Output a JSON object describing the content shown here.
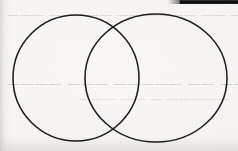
{
  "document": {
    "kind": "scanned-page-photo",
    "caption": "Two overlapping circles drawn in dark ink on off-white paper",
    "background_color": "#f5f4f2",
    "ink_color": "#1e1c1b",
    "ghost_text_color": "#b9b6b1",
    "edge_bar_color": "#0c0c0c"
  },
  "figure": {
    "name": "two-overlapping-circles",
    "type": "venn-diagram",
    "shape_count": 2,
    "stroke_width_px": 1.55,
    "circles": [
      {
        "label": "left-circle",
        "center_x": 76,
        "center_y": 78,
        "radius_x": 63,
        "radius_y": 63
      },
      {
        "label": "right-circle",
        "center_x": 156,
        "center_y": 78,
        "radius_x": 71,
        "radius_y": 64
      }
    ],
    "intersections": [
      {
        "label": "upper-intersection",
        "x": 116,
        "y": 28
      },
      {
        "label": "lower-intersection",
        "x": 116,
        "y": 130
      }
    ]
  },
  "artifacts": {
    "edge_bar": {
      "label": "page-edge-bar",
      "x": 180,
      "y": 0,
      "width": 58,
      "height": 4
    },
    "ghost_text": {
      "note": "Mirrored bleed-through from the reverse side of the sheet; illegible",
      "lines": [
        {
          "id": "ghost-line-1",
          "text": "— —— ———— —— ————— ———"
        },
        {
          "id": "ghost-line-2",
          "text": "———— —— ————— ——— ————"
        },
        {
          "id": "ghost-line-3",
          "text": "————— — —— ———"
        }
      ]
    }
  }
}
